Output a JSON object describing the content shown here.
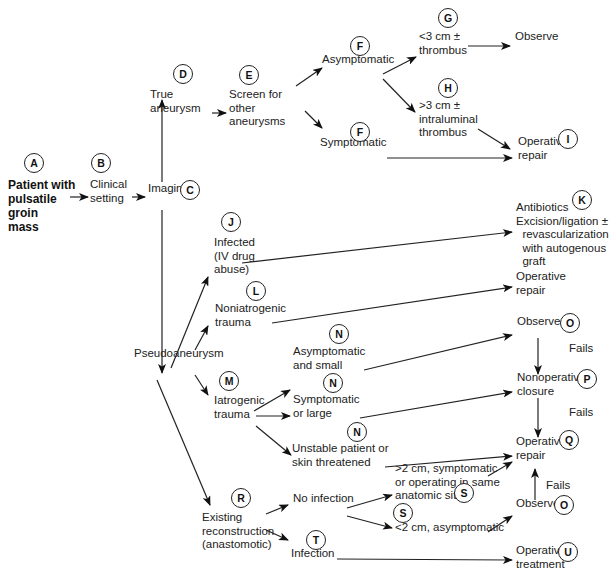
{
  "diagram": {
    "type": "clinical-algorithm-flowchart",
    "nodes": [
      {
        "id": "A",
        "label": "Patient with\npulsatile\ngroin\nmass",
        "x": 8,
        "y": 189,
        "bold": true,
        "badge": {
          "x": 34,
          "y": 163
        }
      },
      {
        "id": "B",
        "label": "Clinical\nsetting",
        "x": 90,
        "y": 189,
        "badge": {
          "x": 101,
          "y": 163
        }
      },
      {
        "id": "C",
        "label": "Imaging",
        "x": 148,
        "y": 193,
        "badge": {
          "x": 190,
          "y": 190
        }
      },
      {
        "id": "D",
        "label": "True\naneurysm",
        "x": 150,
        "y": 99,
        "badge": {
          "x": 183,
          "y": 74
        }
      },
      {
        "id": "E",
        "label": "Screen for\nother\naneurysms",
        "x": 229,
        "y": 99,
        "badge": {
          "x": 249,
          "y": 75
        }
      },
      {
        "id": "F1",
        "label": "Asymptomatic",
        "x": 322,
        "y": 64,
        "badge": {
          "x": 360,
          "y": 46
        }
      },
      {
        "id": "G",
        "label": "<3 cm ±\nthrombus",
        "x": 419,
        "y": 41,
        "badge": {
          "x": 448,
          "y": 18
        }
      },
      {
        "id": "Observe1",
        "label": "Observe",
        "x": 515,
        "y": 41
      },
      {
        "id": "H",
        "label": ">3 cm ±\nintraluminal\nthrombus",
        "x": 419,
        "y": 110,
        "badge": {
          "x": 448,
          "y": 88
        }
      },
      {
        "id": "F2",
        "label": "Symptomatic",
        "x": 320,
        "y": 147,
        "badge": {
          "x": 360,
          "y": 132
        }
      },
      {
        "id": "I",
        "label": "Operative\nrepair",
        "x": 518,
        "y": 146,
        "badge": {
          "x": 568,
          "y": 139
        }
      },
      {
        "id": "J",
        "label": "Infected\n(IV drug\nabuse)",
        "x": 214,
        "y": 247,
        "badge": {
          "x": 231,
          "y": 222
        }
      },
      {
        "id": "K",
        "label": "Antibiotics\nExcision/ligation ±\n  revascularization\n  with autogenous\n  graft",
        "x": 516,
        "y": 212,
        "badge": {
          "x": 582,
          "y": 200
        }
      },
      {
        "id": "L",
        "label": "Noniatrogenic\ntrauma",
        "x": 215,
        "y": 313,
        "badge": {
          "x": 256,
          "y": 291
        }
      },
      {
        "id": "Operative1",
        "label": "Operative\nrepair",
        "x": 516,
        "y": 281
      },
      {
        "id": "Pseudo",
        "label": "Pseudoaneurysm",
        "x": 134,
        "y": 358
      },
      {
        "id": "M",
        "label": "Iatrogenic\ntrauma",
        "x": 214,
        "y": 405,
        "badge": {
          "x": 229,
          "y": 381
        }
      },
      {
        "id": "N1",
        "label": "Asymptomatic\nand small",
        "x": 293,
        "y": 356,
        "badge": {
          "x": 339,
          "y": 334
        }
      },
      {
        "id": "N2",
        "label": "Symptomatic\nor large",
        "x": 293,
        "y": 404,
        "badge": {
          "x": 333,
          "y": 383
        }
      },
      {
        "id": "N3",
        "label": "Unstable patient or\nskin threatened",
        "x": 292,
        "y": 453,
        "badge": {
          "x": 357,
          "y": 432
        }
      },
      {
        "id": "O1",
        "label": "Observe",
        "x": 517,
        "y": 326,
        "badge": {
          "x": 570,
          "y": 323
        }
      },
      {
        "id": "P",
        "label": "Nonoperative\nclosure",
        "x": 517,
        "y": 382,
        "badge": {
          "x": 587,
          "y": 379
        }
      },
      {
        "id": "Q",
        "label": "Operative\nrepair",
        "x": 516,
        "y": 446,
        "badge": {
          "x": 569,
          "y": 440
        }
      },
      {
        "id": "R",
        "label": "Existing\nreconstruction\n(anastomotic)",
        "x": 202,
        "y": 522,
        "badge": {
          "x": 241,
          "y": 498
        }
      },
      {
        "id": "NoInf",
        "label": "No infection",
        "x": 293,
        "y": 503
      },
      {
        "id": "S1",
        "label": ">2 cm, symptomatic\nor operating in same\nanatomic site",
        "x": 395,
        "y": 473,
        "badge": {
          "x": 464,
          "y": 493
        }
      },
      {
        "id": "S2",
        "label": "<2 cm, asymptomatic",
        "x": 395,
        "y": 532,
        "badge": {
          "x": 403,
          "y": 513
        }
      },
      {
        "id": "O2",
        "label": "Observe",
        "x": 516,
        "y": 508,
        "badge": {
          "x": 564,
          "y": 505
        }
      },
      {
        "id": "T",
        "label": "Infection",
        "x": 291,
        "y": 558,
        "badge": {
          "x": 316,
          "y": 540
        }
      },
      {
        "id": "U",
        "label": "Operative\ntreatment",
        "x": 516,
        "y": 555,
        "badge": {
          "x": 568,
          "y": 552
        }
      }
    ],
    "edge_labels": [
      {
        "text": "Fails",
        "x": 569,
        "y": 350
      },
      {
        "text": "Fails",
        "x": 569,
        "y": 414
      },
      {
        "text": "Fails",
        "x": 546,
        "y": 487
      }
    ],
    "edges": [
      [
        70,
        197,
        88,
        197
      ],
      [
        132,
        197,
        145,
        197
      ],
      [
        162,
        182,
        162,
        100
      ],
      [
        212,
        113,
        226,
        113
      ],
      [
        296,
        86,
        322,
        68
      ],
      [
        383,
        74,
        416,
        57
      ],
      [
        383,
        79,
        415,
        112
      ],
      [
        305,
        111,
        322,
        128
      ],
      [
        387,
        158,
        512,
        158
      ],
      [
        468,
        46,
        510,
        46
      ],
      [
        478,
        129,
        510,
        149
      ],
      [
        162,
        210,
        162,
        373
      ],
      [
        242,
        263,
        512,
        232
      ],
      [
        272,
        323,
        512,
        287
      ],
      [
        171,
        368,
        208,
        277
      ],
      [
        195,
        350,
        208,
        326
      ],
      [
        195,
        375,
        208,
        395
      ],
      [
        254,
        411,
        290,
        390
      ],
      [
        256,
        416,
        290,
        416
      ],
      [
        256,
        426,
        291,
        455
      ],
      [
        364,
        370,
        512,
        335
      ],
      [
        360,
        418,
        512,
        392
      ],
      [
        385,
        467,
        512,
        456
      ],
      [
        157,
        380,
        210,
        505
      ],
      [
        538,
        338,
        538,
        374
      ],
      [
        538,
        398,
        538,
        437
      ],
      [
        266,
        514,
        288,
        505
      ],
      [
        266,
        530,
        288,
        540
      ],
      [
        347,
        508,
        392,
        495
      ],
      [
        347,
        516,
        392,
        528
      ],
      [
        488,
        476,
        512,
        462
      ],
      [
        488,
        532,
        512,
        516
      ],
      [
        535,
        500,
        535,
        469
      ],
      [
        337,
        559,
        512,
        560
      ]
    ]
  }
}
